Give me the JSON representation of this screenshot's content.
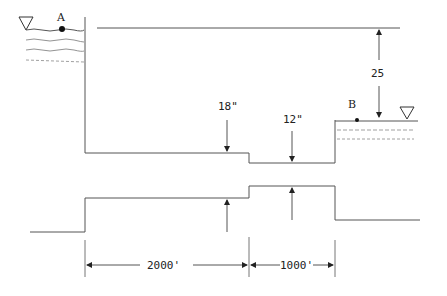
{
  "diagram": {
    "reservoir_a": {
      "label": "A",
      "surface_symbol": "water-surface-triangle"
    },
    "reservoir_b": {
      "label": "B",
      "surface_symbol": "water-surface-triangle"
    },
    "head_difference": {
      "label": "25"
    },
    "pipe_1": {
      "diameter_label": "18\"",
      "length_label": "2000'"
    },
    "pipe_2": {
      "diameter_label": "12\"",
      "length_label": "1000'"
    },
    "colors": {
      "line": "#555555",
      "text": "#222222",
      "background": "#ffffff"
    }
  }
}
